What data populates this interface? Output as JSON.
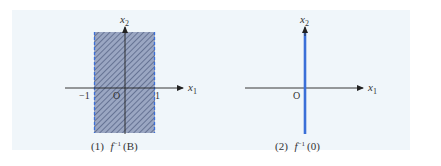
{
  "figure": {
    "background_color": "#f0f6fa",
    "panels": [
      {
        "id": "panel-1",
        "caption_number": "(1)",
        "caption_func": "f",
        "caption_sup": "−1",
        "caption_arg": "(B)",
        "axes": {
          "x_label": "x",
          "x_sub": "1",
          "y_label": "x",
          "y_sub": "2",
          "origin": "O"
        },
        "ticks": {
          "neg_one": "−1",
          "pos_one": "1"
        },
        "region": {
          "description": "vertical strip −1 ≤ x1 ≤ 1, hatched",
          "fill_color": "#8593b3",
          "border_color": "#3a6fd8",
          "border_style": "dashed"
        }
      },
      {
        "id": "panel-2",
        "caption_number": "(2)",
        "caption_func": "f",
        "caption_sup": "−1",
        "caption_arg": "(0)",
        "axes": {
          "x_label": "x",
          "x_sub": "1",
          "y_label": "x",
          "y_sub": "2",
          "origin": "O"
        },
        "line": {
          "description": "x2-axis (x1 = 0), highlighted",
          "color": "#3a6fd8"
        }
      }
    ]
  }
}
